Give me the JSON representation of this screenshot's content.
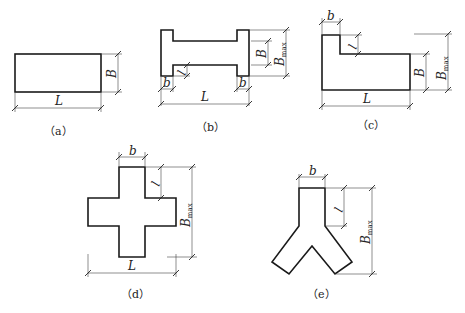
{
  "figures": [
    {
      "id": "a",
      "caption": "（a）",
      "shape": "rectangle",
      "labels": {
        "length": "L",
        "width": "B"
      }
    },
    {
      "id": "b",
      "caption": "（b）",
      "shape": "I-shape",
      "labels": {
        "length": "L",
        "width": "B",
        "max_width": "B",
        "max_sub": "max",
        "flange": "b",
        "projection": "l"
      }
    },
    {
      "id": "c",
      "caption": "（c）",
      "shape": "L-shape",
      "labels": {
        "length": "L",
        "width": "B",
        "max_width": "B",
        "max_sub": "max",
        "flange": "b",
        "projection": "l"
      }
    },
    {
      "id": "d",
      "caption": "（d）",
      "shape": "cross",
      "labels": {
        "length": "L",
        "max_width": "B",
        "max_sub": "max",
        "flange": "b",
        "projection": "l"
      }
    },
    {
      "id": "e",
      "caption": "（e）",
      "shape": "Y-shape",
      "labels": {
        "max_width": "B",
        "max_sub": "max",
        "flange": "b",
        "projection": "l"
      }
    }
  ]
}
